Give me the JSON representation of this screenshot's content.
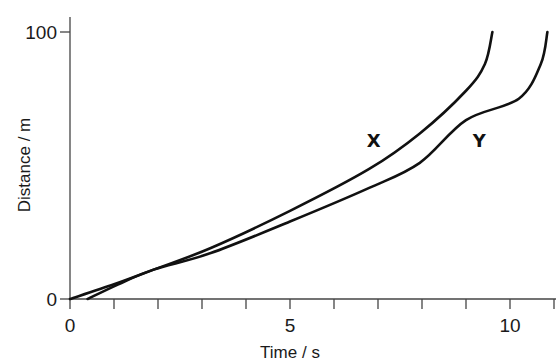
{
  "chart_data": {
    "type": "line",
    "title": "",
    "xlabel": "Time / s",
    "ylabel": "Distance / m",
    "xlim": [
      0,
      11
    ],
    "ylim": [
      0,
      100
    ],
    "x_ticks": [
      0,
      1,
      2,
      3,
      4,
      5,
      6,
      7,
      8,
      9,
      10,
      11
    ],
    "x_tick_labels": [
      {
        "value": 0,
        "label": "0"
      },
      {
        "value": 5,
        "label": "5"
      },
      {
        "value": 10,
        "label": "10"
      }
    ],
    "y_ticks": [
      {
        "value": 0,
        "label": "0"
      },
      {
        "value": 100,
        "label": "100"
      }
    ],
    "grid": false,
    "legend": "none",
    "series": [
      {
        "name": "X",
        "label_at": {
          "x": 6.9,
          "y": 57
        },
        "x": [
          0,
          1,
          1.9,
          3.2,
          5,
          6.8,
          7.95,
          9.0,
          9.43,
          9.6
        ],
        "y": [
          0,
          5.5,
          11,
          19.1,
          33,
          48.7,
          62,
          78,
          88,
          100
        ]
      },
      {
        "name": "Y",
        "label_at": {
          "x": 9.3,
          "y": 57
        },
        "x": [
          0.4,
          1.1,
          1.9,
          3.2,
          5,
          6.8,
          7.95,
          9.0,
          10.2,
          10.7,
          10.85
        ],
        "y": [
          0,
          5.5,
          11,
          17.2,
          29,
          41.6,
          51,
          67,
          75,
          88,
          100
        ]
      }
    ]
  }
}
